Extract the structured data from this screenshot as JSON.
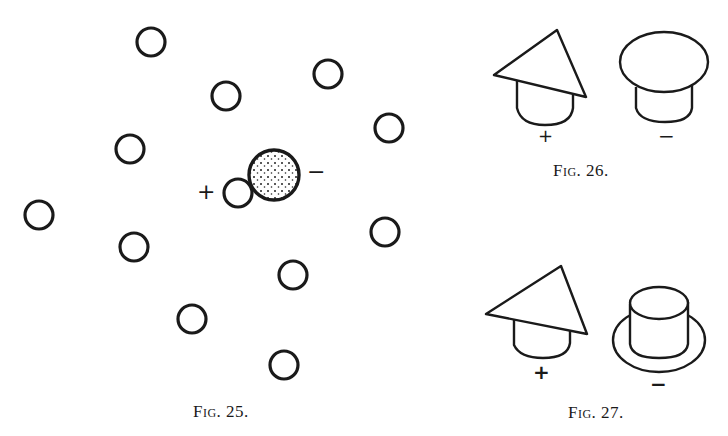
{
  "figures": [
    {
      "id": "fig25",
      "caption": "Fig. 25.",
      "description": "Scattered open circles with one small circle (+) touching a large stippled circle (−)",
      "open_circles": [
        {
          "cx": 151,
          "cy": 42
        },
        {
          "cx": 226,
          "cy": 96
        },
        {
          "cx": 328,
          "cy": 74
        },
        {
          "cx": 389,
          "cy": 128
        },
        {
          "cx": 130,
          "cy": 149
        },
        {
          "cx": 39,
          "cy": 215
        },
        {
          "cx": 134,
          "cy": 247
        },
        {
          "cx": 385,
          "cy": 232
        },
        {
          "cx": 293,
          "cy": 275
        },
        {
          "cx": 192,
          "cy": 319
        },
        {
          "cx": 284,
          "cy": 365
        }
      ],
      "plus_label": "+",
      "minus_label": "−"
    },
    {
      "id": "fig26",
      "caption": "Fig. 26.",
      "left_label": "+",
      "right_label": "−",
      "left_shape": "cone-over-cup",
      "right_shape": "mushroom-cap-over-cup"
    },
    {
      "id": "fig27",
      "caption": "Fig. 27.",
      "left_label": "+",
      "right_label": "−",
      "left_shape": "cone-over-cup",
      "right_shape": "top-hat-with-brim"
    }
  ]
}
